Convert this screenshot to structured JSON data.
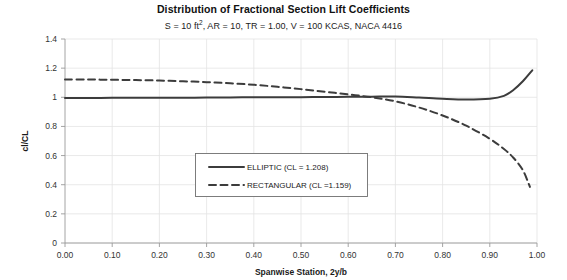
{
  "chart_data": {
    "type": "line",
    "title": "Distribution of Fractional Section Lift Coefficients",
    "subtitle_parts": {
      "pre": "S = 10 ft",
      "sup": "2",
      "post": ",  AR = 10, TR = 1.00, V = 100 KCAS, NACA 4416"
    },
    "subtitle": "S = 10 ft2,  AR = 10, TR = 1.00, V = 100 KCAS, NACA 4416",
    "xlabel": "Spanwise Station, 2y/b",
    "ylabel": "cl/CL",
    "xlim": [
      0.0,
      1.0
    ],
    "ylim": [
      0.0,
      1.4
    ],
    "xticks": [
      "0.00",
      "0.10",
      "0.20",
      "0.30",
      "0.40",
      "0.50",
      "0.60",
      "0.70",
      "0.80",
      "0.90",
      "1.00"
    ],
    "xtick_values": [
      0.0,
      0.1,
      0.2,
      0.3,
      0.4,
      0.5,
      0.6,
      0.7,
      0.8,
      0.9,
      1.0
    ],
    "yticks": [
      "0",
      "0.2",
      "0.4",
      "0.6",
      "0.8",
      "1",
      "1.2",
      "1.4"
    ],
    "ytick_values": [
      0,
      0.2,
      0.4,
      0.6,
      0.8,
      1.0,
      1.2,
      1.4
    ],
    "grid": true,
    "legend_position": "center",
    "line_color": "#3c3c3c",
    "grid_color": "#e3e3e3",
    "series": [
      {
        "name": "ELLIPTIC (CL = 1.208)",
        "style": "solid",
        "x": [
          0.0,
          0.05,
          0.1,
          0.15,
          0.2,
          0.25,
          0.3,
          0.35,
          0.4,
          0.45,
          0.5,
          0.55,
          0.6,
          0.65,
          0.7,
          0.75,
          0.8,
          0.85,
          0.9,
          0.93,
          0.95,
          0.97,
          0.99
        ],
        "values": [
          0.995,
          0.995,
          0.996,
          0.996,
          0.997,
          0.997,
          0.998,
          0.999,
          1.0,
          1.0,
          1.001,
          1.002,
          1.003,
          1.004,
          1.005,
          0.998,
          0.99,
          0.985,
          0.99,
          1.01,
          1.05,
          1.11,
          1.185
        ]
      },
      {
        "name": "RECTANGULAR (CL =1.159)",
        "style": "dashed",
        "x": [
          0.0,
          0.05,
          0.1,
          0.15,
          0.2,
          0.25,
          0.3,
          0.35,
          0.4,
          0.45,
          0.5,
          0.55,
          0.6,
          0.65,
          0.7,
          0.75,
          0.8,
          0.85,
          0.9,
          0.93,
          0.95,
          0.97,
          0.985
        ],
        "values": [
          1.122,
          1.122,
          1.12,
          1.118,
          1.115,
          1.11,
          1.104,
          1.096,
          1.086,
          1.072,
          1.056,
          1.038,
          1.02,
          1.0,
          0.972,
          0.93,
          0.875,
          0.805,
          0.715,
          0.645,
          0.585,
          0.5,
          0.385
        ]
      }
    ]
  }
}
